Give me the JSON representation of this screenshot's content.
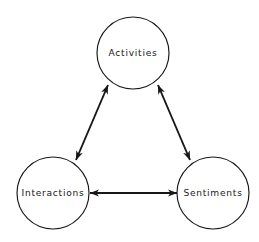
{
  "diagram": {
    "type": "node-link-diagram",
    "background_color": "#ffffff",
    "stroke_color": "#17171a",
    "nodes": [
      {
        "id": "activities",
        "label": "Activities",
        "cx": 133,
        "cy": 53,
        "r": 36,
        "position": "top"
      },
      {
        "id": "interactions",
        "label": "Interactions",
        "cx": 53,
        "cy": 193,
        "r": 36,
        "position": "bottom-left"
      },
      {
        "id": "sentiments",
        "label": "Sentiments",
        "cx": 213,
        "cy": 193,
        "r": 36,
        "position": "bottom-right"
      }
    ],
    "edges": [
      {
        "id": "activities-interactions",
        "from": "activities",
        "to": "interactions",
        "arrow": "double",
        "x1": 108,
        "y1": 85,
        "x2": 76,
        "y2": 160
      },
      {
        "id": "activities-sentiments",
        "from": "activities",
        "to": "sentiments",
        "arrow": "double",
        "x1": 158,
        "y1": 85,
        "x2": 190,
        "y2": 160
      },
      {
        "id": "interactions-sentiments",
        "from": "interactions",
        "to": "sentiments",
        "arrow": "double",
        "x1": 90,
        "y1": 193,
        "x2": 177,
        "y2": 193
      }
    ]
  }
}
